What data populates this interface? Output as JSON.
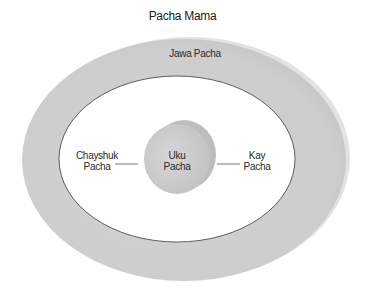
{
  "title": "Pacha Mama",
  "rings": {
    "outer": {
      "label": "Jawa Pacha",
      "color": "#cfcfcf"
    },
    "middle": {
      "label_left_line1": "Chayshuk",
      "label_left_line2": "Pacha",
      "label_right_line1": "Kay",
      "label_right_line2": "Pacha",
      "color": "#ffffff"
    },
    "center": {
      "label_line1": "Uku",
      "label_line2": "Pacha",
      "color": "#cccccc"
    }
  }
}
